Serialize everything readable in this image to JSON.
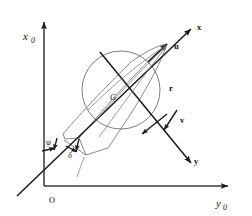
{
  "figure": {
    "background_color": "#ffffff",
    "line_color": "#1a1a1a",
    "hull_color": "#7a7a7a",
    "circle_color": "#6e6e6e"
  },
  "labels": {
    "axis_x0": "x",
    "axis_x0_sub": "0",
    "axis_y0": "y",
    "axis_y0_sub": "0",
    "origin": "O",
    "body_axis_x": "x",
    "body_axis_y": "y",
    "surge_velocity": "u",
    "sway_velocity": "v",
    "yaw_rate": "r",
    "center_of_gravity": "G",
    "heading_angle": "ψ",
    "drift_angle": "δ"
  },
  "geometry": {
    "origin_point": [
      44,
      186
    ],
    "vertical_axis_top": [
      44,
      18
    ],
    "horizontal_axis_right": [
      232,
      186
    ],
    "body_x_axis_start": [
      17,
      196
    ],
    "body_x_axis_end": [
      196,
      24
    ],
    "body_y_axis_start": [
      100,
      52
    ],
    "body_y_axis_end": [
      196,
      170
    ],
    "cg_point": [
      118,
      99
    ],
    "circle_center": [
      121,
      90
    ],
    "circle_radius": 39,
    "u_arrow_tip": [
      168,
      41
    ],
    "v_arrow_tips": [
      [
        143,
        134
      ],
      [
        166,
        130
      ]
    ],
    "hull_bow": [
      168,
      43
    ],
    "hull_stern_left": [
      64,
      140
    ],
    "hull_stern_right": [
      83,
      156
    ]
  }
}
